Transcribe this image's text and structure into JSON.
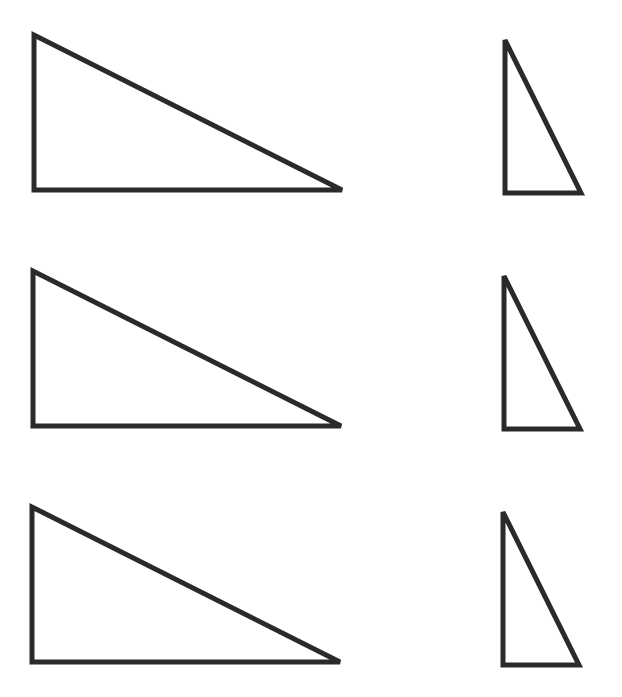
{
  "diagram": {
    "stroke_color": "#2a2a2a",
    "background": "#ffffff",
    "rows": [
      {
        "left": {
          "points": "34,35 34,190 342,190"
        },
        "right": {
          "points": "505,40 505,193 581,193"
        }
      },
      {
        "left": {
          "points": "33,271 33,426 341,426"
        },
        "right": {
          "points": "504,276 504,429 580,429"
        }
      },
      {
        "left": {
          "points": "32,507 32,662 340,662"
        },
        "right": {
          "points": "503,512 503,665 579,665"
        }
      }
    ]
  }
}
